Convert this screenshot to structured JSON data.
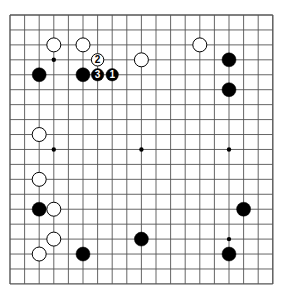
{
  "board": {
    "size": 19,
    "origin_x": 10,
    "origin_y": 15,
    "spacing_x": 14.6,
    "spacing_y": 14.94,
    "line_color": "#555555",
    "background": "#ffffff",
    "hoshi": [
      [
        3,
        3
      ],
      [
        3,
        9
      ],
      [
        9,
        9
      ],
      [
        15,
        9
      ],
      [
        15,
        15
      ],
      [
        9,
        3
      ],
      [
        9,
        15
      ],
      [
        3,
        15
      ],
      [
        15,
        3
      ]
    ],
    "stones": [
      {
        "color": "white",
        "col": 3,
        "row": 2
      },
      {
        "color": "white",
        "col": 5,
        "row": 2
      },
      {
        "color": "white",
        "col": 6,
        "row": 3,
        "label": "2"
      },
      {
        "color": "white",
        "col": 9,
        "row": 3
      },
      {
        "color": "black",
        "col": 2,
        "row": 4
      },
      {
        "color": "black",
        "col": 5,
        "row": 4
      },
      {
        "color": "black",
        "col": 6,
        "row": 4,
        "label": "3"
      },
      {
        "color": "black",
        "col": 7,
        "row": 4,
        "label": "1"
      },
      {
        "color": "white",
        "col": 13,
        "row": 2
      },
      {
        "color": "black",
        "col": 15,
        "row": 3
      },
      {
        "color": "black",
        "col": 15,
        "row": 5
      },
      {
        "color": "white",
        "col": 2,
        "row": 8
      },
      {
        "color": "white",
        "col": 2,
        "row": 11
      },
      {
        "color": "black",
        "col": 2,
        "row": 13
      },
      {
        "color": "white",
        "col": 3,
        "row": 13
      },
      {
        "color": "white",
        "col": 3,
        "row": 15
      },
      {
        "color": "white",
        "col": 2,
        "row": 16
      },
      {
        "color": "black",
        "col": 5,
        "row": 16
      },
      {
        "color": "black",
        "col": 9,
        "row": 15
      },
      {
        "color": "black",
        "col": 16,
        "row": 13
      },
      {
        "color": "black",
        "col": 15,
        "row": 16
      }
    ]
  }
}
